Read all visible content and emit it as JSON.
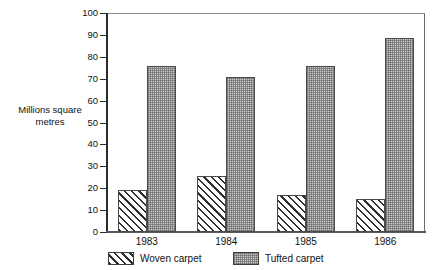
{
  "chart_data": {
    "type": "bar",
    "title": "",
    "subtitle": "",
    "xlabel": "",
    "ylabel": "Millions square\nmetres",
    "ylabel_line1": "Millions square",
    "ylabel_line2": "metres",
    "categories": [
      "1983",
      "1984",
      "1985",
      "1986"
    ],
    "series": [
      {
        "name": "Woven carpet",
        "values": [
          19,
          25.5,
          17,
          15
        ],
        "fill": "diagonal-hatch",
        "color": "#ffffff"
      },
      {
        "name": "Tufted carpet",
        "values": [
          76,
          71,
          76,
          88.5
        ],
        "fill": "stipple-grey",
        "color": "#c9c9c9"
      }
    ],
    "ylim": [
      0,
      100
    ],
    "ytick_step": 10,
    "yticks": [
      0,
      10,
      20,
      30,
      40,
      50,
      60,
      70,
      80,
      90,
      100
    ],
    "ytick_labels": [
      "0",
      "10",
      "20",
      "30",
      "40",
      "50",
      "60",
      "70",
      "80",
      "90",
      "100"
    ],
    "grid": false,
    "legend_position": "bottom-left",
    "legend": [
      "Woven carpet",
      "Tufted carpet"
    ]
  }
}
